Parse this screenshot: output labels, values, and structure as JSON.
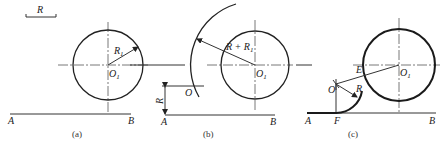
{
  "figure": {
    "panels": [
      {
        "caption": "(a)",
        "scale_label": "R",
        "circle_center_label": "O",
        "circle_center_sub": "1",
        "radius_label": "R",
        "radius_sub": "1",
        "line_start_label": "A",
        "line_end_label": "B"
      },
      {
        "caption": "(b)",
        "arc_radius_label": "R + R",
        "arc_radius_sub": "1",
        "circle_center_label": "O",
        "circle_center_sub": "1",
        "point_label": "O",
        "offset_label": "R",
        "line_start_label": "A",
        "line_end_label": "B"
      },
      {
        "caption": "(c)",
        "tangent_point_label": "E",
        "circle_center_label": "O",
        "circle_center_sub": "1",
        "point_label": "O",
        "radius_label": "R",
        "foot_label": "F",
        "line_start_label": "A",
        "line_end_label": "B"
      }
    ],
    "colors": {
      "stroke": "#222222",
      "background": "#ffffff"
    }
  }
}
